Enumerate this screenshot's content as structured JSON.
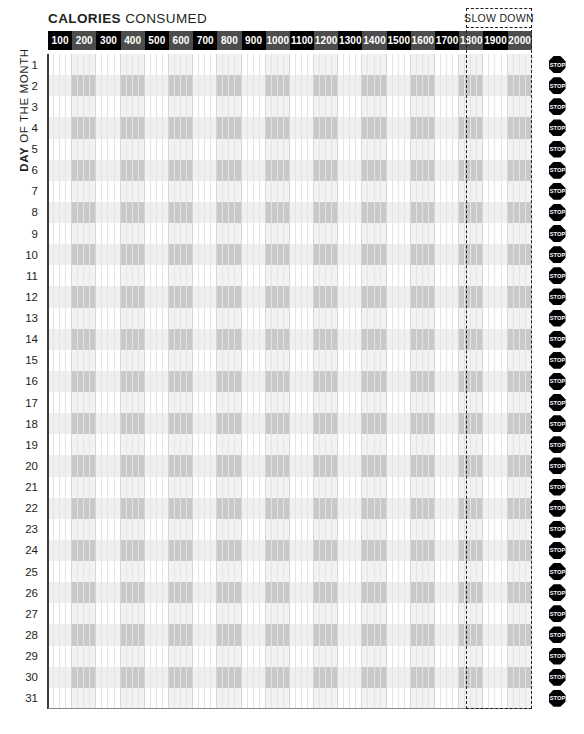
{
  "header": {
    "title_strong": "CALORIES",
    "title_light": "CONSUMED",
    "slow_down_label": "SLOW DOWN"
  },
  "axis": {
    "y_label_strong": "DAY",
    "y_label_light": "OF THE MONTH"
  },
  "chart_data": {
    "type": "table",
    "title": "CALORIES CONSUMED",
    "xlabel": "CALORIES CONSUMED",
    "ylabel": "DAY OF THE MONTH",
    "grid": true,
    "legend": "none",
    "columns": [
      "100",
      "200",
      "300",
      "400",
      "500",
      "600",
      "700",
      "800",
      "900",
      "1000",
      "1100",
      "1200",
      "1300",
      "1400",
      "1500",
      "1600",
      "1700",
      "1800",
      "1900",
      "2000"
    ],
    "column_values": [
      100,
      200,
      300,
      400,
      500,
      600,
      700,
      800,
      900,
      1000,
      1100,
      1200,
      1300,
      1400,
      1500,
      1600,
      1700,
      1800,
      1900,
      2000
    ],
    "rows": [
      "1",
      "2",
      "3",
      "4",
      "5",
      "6",
      "7",
      "8",
      "9",
      "10",
      "11",
      "12",
      "13",
      "14",
      "15",
      "16",
      "17",
      "18",
      "19",
      "20",
      "21",
      "22",
      "23",
      "24",
      "25",
      "26",
      "27",
      "28",
      "29",
      "30",
      "31"
    ],
    "row_values": [
      1,
      2,
      3,
      4,
      5,
      6,
      7,
      8,
      9,
      10,
      11,
      12,
      13,
      14,
      15,
      16,
      17,
      18,
      19,
      20,
      21,
      22,
      23,
      24,
      25,
      26,
      27,
      28,
      29,
      30,
      31
    ],
    "values": [],
    "xlim": [
      100,
      2000
    ],
    "ylim": [
      1,
      31
    ],
    "annotations": [
      {
        "label": "SLOW DOWN",
        "covers_columns": [
          "1800",
          "1900",
          "2000"
        ],
        "style": "dashed-box"
      },
      {
        "label": "STOP",
        "position": "end-of-row",
        "repeats": 31,
        "style": "octagon-sign"
      }
    ]
  },
  "stop_sign": {
    "label": "STOP",
    "count": 31
  },
  "colors": {
    "ink": "#231f20",
    "header_dark": "#000000",
    "header_mid": "#4d4d4d",
    "row_band": "#efefef",
    "column_shade": "#c9c9c9",
    "grid_line": "#d7d7d7",
    "stop_sign": "#000000",
    "page": "#ffffff"
  }
}
